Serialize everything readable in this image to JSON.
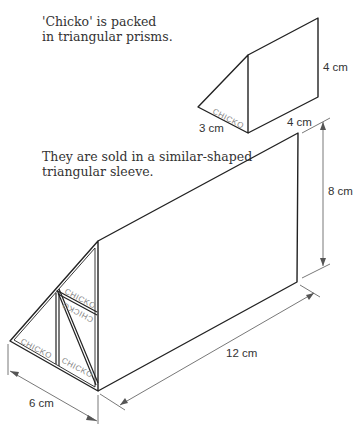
{
  "captions": {
    "intro_line1": "'Chicko' is packed",
    "intro_line2": "in triangular prisms.",
    "sleeve_line1": "They are sold in a similar-shaped",
    "sleeve_line2": "triangular sleeve."
  },
  "small_prism": {
    "brand": "CHICKO",
    "base_label": "3 cm",
    "height_label": "4 cm",
    "length_label": "4 cm"
  },
  "large_sleeve": {
    "brand": "CHICKO",
    "base_label": "6 cm",
    "height_label": "8 cm",
    "length_label": "12 cm",
    "packed_prisms": 4
  },
  "colors": {
    "line": "#222222",
    "dim_line": "#555555",
    "text": "#333333"
  }
}
